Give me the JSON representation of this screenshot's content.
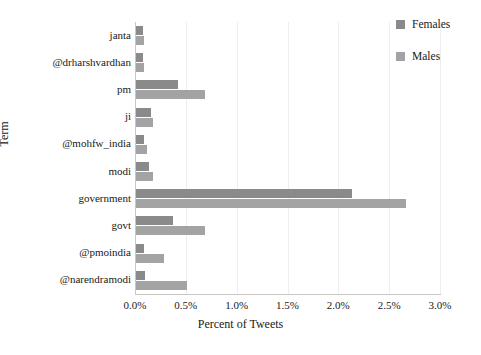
{
  "chart_data": {
    "type": "bar",
    "orientation": "horizontal",
    "title": "",
    "xlabel": "Percent of Tweets",
    "ylabel": "Term",
    "categories": [
      "janta",
      "@drharshvardhan",
      "pm",
      "ji",
      "@mohfw_india",
      "modi",
      "government",
      "govt",
      "@pmoindia",
      "@narendramodi"
    ],
    "series": [
      {
        "name": "Females",
        "color": "#8a8a8a",
        "values": [
          0.08,
          0.08,
          0.42,
          0.16,
          0.09,
          0.14,
          2.13,
          0.37,
          0.09,
          0.1
        ]
      },
      {
        "name": "Males",
        "color": "#a3a3a3",
        "values": [
          0.09,
          0.09,
          0.69,
          0.18,
          0.12,
          0.18,
          2.67,
          0.69,
          0.29,
          0.51
        ]
      }
    ],
    "xlim": [
      0.0,
      3.0
    ],
    "xticks": [
      0.0,
      0.5,
      1.0,
      1.5,
      2.0,
      2.5,
      3.0
    ],
    "xtick_labels": [
      "0.0%",
      "0.5%",
      "1.0%",
      "1.5%",
      "2.0%",
      "2.5%",
      "3.0%"
    ],
    "grid": true,
    "grid_axis": "x",
    "legend_position": "top-right",
    "legend_entries": [
      "Females",
      "Males"
    ],
    "background_color": "#ffffff",
    "axis_color": "#c9c7c4",
    "grid_color": "#efeeee"
  }
}
